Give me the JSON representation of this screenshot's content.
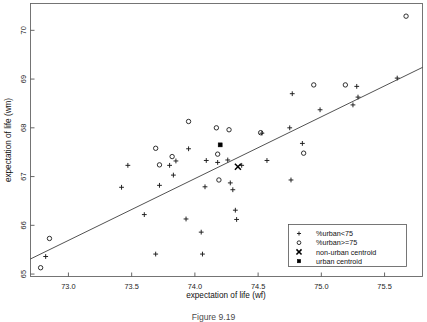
{
  "caption": "Figure 9.19",
  "chart_data": {
    "type": "scatter",
    "title": "",
    "xlabel": "expectation of life (wf)",
    "ylabel": "expectation of life (wm)",
    "xlim": [
      72.7,
      75.8
    ],
    "ylim": [
      64.95,
      70.55
    ],
    "xticks": [
      "73.0",
      "73.5",
      "74.0",
      "74.5",
      "75.0",
      "75.5"
    ],
    "xtick_values": [
      73.0,
      73.5,
      74.0,
      74.5,
      75.0,
      75.5
    ],
    "yticks": [
      "65",
      "66",
      "67",
      "68",
      "69",
      "70"
    ],
    "ytick_values": [
      65,
      66,
      67,
      68,
      69,
      70
    ],
    "grid": false,
    "legend_position": "lower right",
    "legend": [
      {
        "marker": "plus-marker",
        "label": "%urban<75"
      },
      {
        "marker": "circle-marker",
        "label": "%urban>=75"
      },
      {
        "marker": "x-marker",
        "label": "non-urban centroid"
      },
      {
        "marker": "square-marker",
        "label": "urban centroid"
      }
    ],
    "fit_line": {
      "name": "regression-line",
      "x": [
        72.7,
        75.8
      ],
      "y": [
        65.31,
        69.24
      ]
    },
    "series": [
      {
        "name": "%urban<75",
        "marker": "plus-marker",
        "points": [
          [
            72.82,
            65.36
          ],
          [
            73.42,
            66.78
          ],
          [
            73.47,
            67.23
          ],
          [
            73.6,
            66.22
          ],
          [
            73.69,
            65.41
          ],
          [
            73.72,
            66.82
          ],
          [
            73.8,
            67.23
          ],
          [
            73.83,
            67.03
          ],
          [
            73.85,
            67.32
          ],
          [
            73.93,
            66.13
          ],
          [
            73.95,
            67.57
          ],
          [
            74.05,
            65.86
          ],
          [
            74.06,
            65.41
          ],
          [
            74.08,
            66.79
          ],
          [
            74.09,
            67.33
          ],
          [
            74.18,
            67.29
          ],
          [
            74.26,
            67.34
          ],
          [
            74.28,
            66.87
          ],
          [
            74.3,
            66.73
          ],
          [
            74.32,
            66.31
          ],
          [
            74.33,
            66.12
          ],
          [
            74.37,
            67.23
          ],
          [
            74.53,
            67.89
          ],
          [
            74.57,
            67.33
          ],
          [
            74.75,
            68.0
          ],
          [
            74.76,
            66.93
          ],
          [
            74.77,
            68.7
          ],
          [
            74.85,
            67.68
          ],
          [
            74.99,
            68.37
          ],
          [
            75.25,
            68.47
          ],
          [
            75.28,
            68.85
          ],
          [
            75.29,
            68.63
          ],
          [
            75.6,
            69.02
          ]
        ]
      },
      {
        "name": "%urban>=75",
        "marker": "circle-marker",
        "points": [
          [
            72.78,
            65.13
          ],
          [
            72.85,
            65.73
          ],
          [
            73.69,
            67.58
          ],
          [
            73.72,
            67.24
          ],
          [
            73.82,
            67.41
          ],
          [
            73.95,
            68.13
          ],
          [
            74.17,
            68.0
          ],
          [
            74.18,
            67.46
          ],
          [
            74.19,
            66.93
          ],
          [
            74.27,
            67.96
          ],
          [
            74.52,
            67.9
          ],
          [
            74.86,
            67.48
          ],
          [
            74.94,
            68.88
          ],
          [
            75.19,
            68.88
          ],
          [
            75.67,
            70.29
          ]
        ]
      },
      {
        "name": "non-urban centroid",
        "marker": "x-marker",
        "points": [
          [
            74.34,
            67.2
          ]
        ]
      },
      {
        "name": "urban centroid",
        "marker": "square-marker",
        "points": [
          [
            74.2,
            67.65
          ]
        ]
      }
    ]
  }
}
